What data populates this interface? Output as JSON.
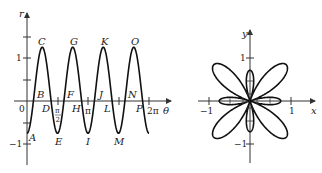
{
  "left_graph": {
    "title": "r versus theta (Cartesian)",
    "x_axis_label": "θ",
    "y_axis_label": "r",
    "y_ticks": [
      {
        "value": 1,
        "label": "1"
      },
      {
        "value": -1,
        "label": "−1"
      }
    ],
    "origin_label": "0",
    "x_ticks": [
      {
        "value": "pi/2",
        "label_num": "π",
        "label_den": "2"
      },
      {
        "value": "pi",
        "label": "π"
      },
      {
        "value": "2pi",
        "label": "2π"
      }
    ],
    "points": [
      {
        "name": "A",
        "label": "A"
      },
      {
        "name": "B",
        "label": "B"
      },
      {
        "name": "C",
        "label": "C"
      },
      {
        "name": "D",
        "label": "D"
      },
      {
        "name": "E",
        "label": "E"
      },
      {
        "name": "F",
        "label": "F"
      },
      {
        "name": "G",
        "label": "G"
      },
      {
        "name": "H",
        "label": "H"
      },
      {
        "name": "I",
        "label": "I"
      },
      {
        "name": "J",
        "label": "J"
      },
      {
        "name": "K",
        "label": "K"
      },
      {
        "name": "L",
        "label": "L"
      },
      {
        "name": "M",
        "label": "M"
      },
      {
        "name": "N",
        "label": "N"
      },
      {
        "name": "O",
        "label": "O"
      },
      {
        "name": "P",
        "label": "P"
      }
    ]
  },
  "right_graph": {
    "title": "polar rose curve",
    "x_axis_label": "x",
    "y_axis_label": "y",
    "x_ticks": [
      {
        "value": -1,
        "label": "−1"
      },
      {
        "value": 1,
        "label": "1"
      }
    ],
    "y_ticks": [
      {
        "value": 1,
        "label": "1"
      },
      {
        "value": -1,
        "label": "−1"
      }
    ]
  },
  "chart_data": [
    {
      "type": "line",
      "title": "",
      "xlabel": "θ",
      "ylabel": "r",
      "function": "r = 1/4 − cos(4θ)",
      "xlim": [
        0,
        6.2832
      ],
      "ylim": [
        -1.3,
        2.1
      ],
      "x_ticks": [
        "0",
        "π/2",
        "π",
        "2π"
      ],
      "y_ticks": [
        "−1",
        "1"
      ],
      "grid": false,
      "labeled_points": [
        {
          "label": "A",
          "theta": 0,
          "r": -0.75
        },
        {
          "label": "B",
          "theta": 0.33,
          "r": 0
        },
        {
          "label": "C",
          "theta": 0.785,
          "r": 1.25
        },
        {
          "label": "D",
          "theta": 1.24,
          "r": 0
        },
        {
          "label": "E",
          "theta": 1.571,
          "r": -0.75
        },
        {
          "label": "F",
          "theta": 1.9,
          "r": 0
        },
        {
          "label": "G",
          "theta": 2.356,
          "r": 1.25
        },
        {
          "label": "H",
          "theta": 2.81,
          "r": 0
        },
        {
          "label": "I",
          "theta": 3.142,
          "r": -0.75
        },
        {
          "label": "J",
          "theta": 3.47,
          "r": 0
        },
        {
          "label": "K",
          "theta": 3.927,
          "r": 1.25
        },
        {
          "label": "L",
          "theta": 4.38,
          "r": 0
        },
        {
          "label": "M",
          "theta": 4.712,
          "r": -0.75
        },
        {
          "label": "N",
          "theta": 5.04,
          "r": 0
        },
        {
          "label": "O",
          "theta": 5.498,
          "r": 1.25
        },
        {
          "label": "P",
          "theta": 5.95,
          "r": 0
        }
      ]
    },
    {
      "type": "line",
      "title": "",
      "xlabel": "x",
      "ylabel": "y",
      "function": "polar r = 1/4 − cos(4θ)",
      "xlim": [
        -1.2,
        1.2
      ],
      "ylim": [
        -1.3,
        1.3
      ],
      "x_ticks": [
        "−1",
        "1"
      ],
      "y_ticks": [
        "−1",
        "1"
      ],
      "grid": false,
      "description": "8-petal rose: 4 large diagonal petals (length 1.25) and 4 small axial petals (length 0.75)"
    }
  ]
}
